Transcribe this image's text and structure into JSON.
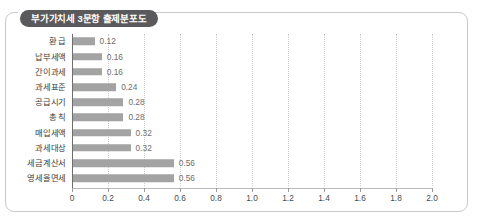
{
  "chart_data": {
    "type": "bar",
    "orientation": "horizontal",
    "title": "부가가치세 3문항 출제분포도",
    "xlabel": "",
    "ylabel": "",
    "xlim": [
      0,
      2.2
    ],
    "grid": true,
    "legend": null,
    "xticks": [
      "0",
      "0.2",
      "0.4",
      "0.6",
      "0.8",
      "1.0",
      "1.2",
      "1.4",
      "1.6",
      "1.8",
      "2.0"
    ],
    "xtick_values": [
      0,
      0.2,
      0.4,
      0.6,
      0.8,
      1.0,
      1.2,
      1.4,
      1.6,
      1.8,
      2.0
    ],
    "categories": [
      "환 급",
      "납부세액",
      "간이과세",
      "과세표준",
      "공급시기",
      "총 칙",
      "매입세액",
      "과세대상",
      "세금계산서",
      "영세율면세"
    ],
    "values": [
      0.12,
      0.16,
      0.16,
      0.24,
      0.28,
      0.28,
      0.32,
      0.32,
      0.56,
      0.56
    ],
    "value_labels": [
      "0.12",
      "0.16",
      "0.16",
      "0.24",
      "0.28",
      "0.28",
      "0.32",
      "0.32",
      "0.56",
      "0.56"
    ],
    "bar_color": "#a3a3a3",
    "title_pill_color": "#5a595b",
    "gridline_color": "#cccccc",
    "frame_color": "#c9c9c9"
  }
}
